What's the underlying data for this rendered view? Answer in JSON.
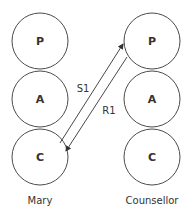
{
  "diagram": {
    "type": "transactional-analysis",
    "people": [
      {
        "name": "Mary",
        "states": [
          {
            "label": "P"
          },
          {
            "label": "A"
          },
          {
            "label": "C"
          }
        ]
      },
      {
        "name": "Counsellor",
        "states": [
          {
            "label": "P"
          },
          {
            "label": "A"
          },
          {
            "label": "C"
          }
        ]
      }
    ],
    "transactions": [
      {
        "label": "S1",
        "from": "Mary.C",
        "to": "Counsellor.P"
      },
      {
        "label": "R1",
        "from": "Counsellor.P",
        "to": "Mary.C"
      }
    ],
    "colors": {
      "stroke": "#4a4a4a",
      "text": "#333333",
      "background": "#ffffff"
    }
  }
}
